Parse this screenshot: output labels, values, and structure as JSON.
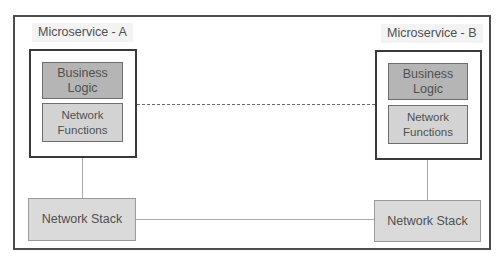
{
  "diagram": {
    "title": "",
    "microservices": [
      {
        "label": "Microservice - A",
        "business_logic": [
          "Business",
          "Logic"
        ],
        "network_functions": [
          "Network",
          "Functions"
        ],
        "network_stack": "Network Stack"
      },
      {
        "label": "Microservice - B",
        "business_logic": [
          "Business",
          "Logic"
        ],
        "network_functions": [
          "Network",
          "Functions"
        ],
        "network_stack": "Network Stack"
      }
    ],
    "connections": [
      {
        "from": "Microservice A Network Functions",
        "to": "Microservice B Network Functions",
        "style": "dashed"
      },
      {
        "from": "Microservice A Network Stack",
        "to": "Microservice B Network Stack",
        "style": "solid"
      },
      {
        "from": "Microservice A container",
        "to": "Microservice A Network Stack",
        "style": "solid"
      },
      {
        "from": "Microservice B container",
        "to": "Microservice B Network Stack",
        "style": "solid"
      }
    ],
    "colors": {
      "frame_border": "#4d4d4d",
      "container_border": "#3a3a3a",
      "business_logic_fill": "#b5b5b5",
      "network_functions_fill": "#d3d3d3",
      "network_stack_fill": "#dadada",
      "label_bg": "#f3f3f3",
      "connector": "#a8a8a8"
    }
  }
}
